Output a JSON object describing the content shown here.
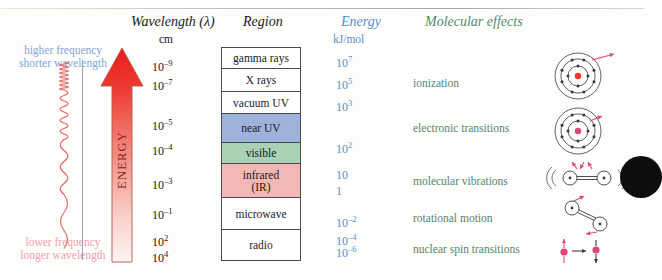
{
  "figure": {
    "title_hidden": "",
    "left_axis": {
      "top_label_line1": "higher frequency",
      "top_label_line2": "shorter wavelength",
      "bottom_label_line1": "lower frequency",
      "bottom_label_line2": "longer wavelength",
      "arrow_label": "ENERGY",
      "arrow_color_top": "#e8201c",
      "arrow_color_bottom": "#fdf4f2",
      "wave_color": "#e8625e",
      "high_freq_color": "#7fa8d6",
      "low_freq_color": "#f0a0b4"
    },
    "headers": {
      "wavelength": "Wavelength (λ)",
      "wavelength_unit": "cm",
      "region": "Region",
      "energy": "Energy",
      "energy_unit": "kJ/mol",
      "molecular_effects": "Molecular effects",
      "energy_color": "#5b8fc9",
      "molecular_color": "#4d8a6e"
    }
  },
  "chart_data": {
    "type": "table",
    "xlabel": "",
    "ylabel": "",
    "grid": false,
    "legend": "none",
    "wavelength_ticks": [
      {
        "value": "10−9",
        "base": "10",
        "exp": "–9",
        "top": 58
      },
      {
        "value": "10−7",
        "base": "10",
        "exp": "–7",
        "top": 77
      },
      {
        "value": "10−5",
        "base": "10",
        "exp": "–5",
        "top": 117
      },
      {
        "value": "10−4",
        "base": "10",
        "exp": "–4",
        "top": 142
      },
      {
        "value": "10−3",
        "base": "10",
        "exp": "–3",
        "top": 176
      },
      {
        "value": "10−1",
        "base": "10",
        "exp": "–1",
        "top": 206
      },
      {
        "value": "10²",
        "base": "10",
        "exp": "2",
        "top": 233
      },
      {
        "value": "10⁴",
        "base": "10",
        "exp": "4",
        "top": 249
      }
    ],
    "regions": [
      {
        "label": "gamma rays",
        "color": "#ffffff",
        "height": 21
      },
      {
        "label": "X rays",
        "color": "#ffffff",
        "height": 23
      },
      {
        "label": "vacuum UV",
        "color": "#ffffff",
        "height": 22
      },
      {
        "label": "near UV",
        "color": "#9fb2dc",
        "height": 29
      },
      {
        "label": "visible",
        "color": "#a9d1b3",
        "height": 21
      },
      {
        "label": "infrared\n(IR)",
        "color": "#f3b8b6",
        "height": 34
      },
      {
        "label": "microwave",
        "color": "#ffffff",
        "height": 32
      },
      {
        "label": "radio",
        "color": "#ffffff",
        "height": 30
      }
    ],
    "energy_ticks": [
      {
        "value": "10⁷",
        "base": "10",
        "exp": "7",
        "top": 54
      },
      {
        "value": "10⁵",
        "base": "10",
        "exp": "5",
        "top": 76
      },
      {
        "value": "10³",
        "base": "10",
        "exp": "3",
        "top": 98
      },
      {
        "value": "10²",
        "base": "10",
        "exp": "2",
        "top": 140
      },
      {
        "value": "10",
        "base": "10",
        "exp": "",
        "top": 168
      },
      {
        "value": "1",
        "base": "1",
        "exp": "",
        "top": 184
      },
      {
        "value": "10−2",
        "base": "10",
        "exp": "–2",
        "top": 214
      },
      {
        "value": "10−4",
        "base": "10",
        "exp": "–4",
        "top": 232
      },
      {
        "value": "10−6",
        "base": "10",
        "exp": "–6",
        "top": 244
      }
    ],
    "molecular_effects": [
      {
        "label": "ionization",
        "top": 77
      },
      {
        "label": "electronic transitions",
        "top": 122
      },
      {
        "label": "molecular vibrations",
        "top": 175
      },
      {
        "label": "rotational motion",
        "top": 212
      },
      {
        "label": "nuclear spin transitions",
        "top": 243
      }
    ],
    "diagrams": [
      {
        "name": "atom-ionization",
        "top": 48,
        "kind": "atom"
      },
      {
        "name": "atom-electronic",
        "top": 103,
        "kind": "atom"
      },
      {
        "name": "diatomic-vibration",
        "top": 160,
        "kind": "vibration"
      },
      {
        "name": "diatomic-rotation",
        "top": 196,
        "kind": "rotation"
      },
      {
        "name": "nuclear-spin",
        "top": 238,
        "kind": "spin"
      }
    ]
  }
}
